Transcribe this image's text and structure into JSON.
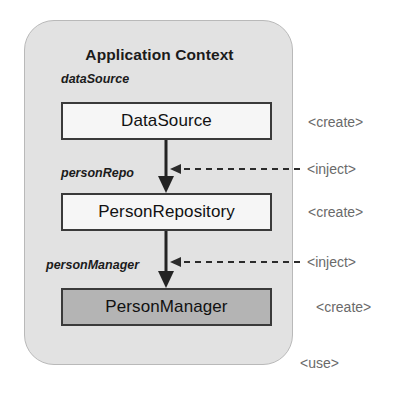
{
  "diagram": {
    "title": "Application Context",
    "container_fill": "#e2e2e2",
    "boxes": [
      {
        "bean_name": "dataSource",
        "type_name": "DataSource",
        "fill": "#f6f6f6"
      },
      {
        "bean_name": "personRepo",
        "type_name": "PersonRepository",
        "fill": "#f6f6f6"
      },
      {
        "bean_name": "personManager",
        "type_name": "PersonManager",
        "fill": "#b4b4b4"
      }
    ],
    "stereotypes": {
      "create_1": "<create>",
      "inject_1": "<inject>",
      "create_2": "<create>",
      "inject_2": "<inject>",
      "create_3": "<create>",
      "use": "<use>"
    }
  }
}
